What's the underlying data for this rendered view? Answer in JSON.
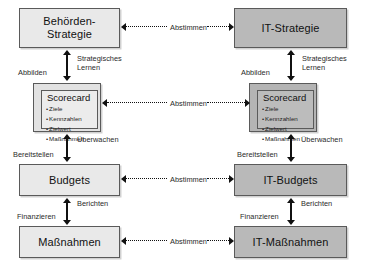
{
  "diagram": {
    "colors": {
      "business_fill": "#e9e9e9",
      "it_fill": "#b9b9b9",
      "border": "#5a5a5a",
      "arrow": "#111111",
      "background": "#ffffff"
    },
    "columns": [
      {
        "id": "business",
        "label": "Behoerde"
      },
      {
        "id": "it",
        "label": "IT"
      }
    ],
    "nodes": {
      "behoerden_strategie": {
        "line1": "Behörden-",
        "line2": "Strategie"
      },
      "it_strategie": {
        "line1": "IT-Strategie",
        "line2": ""
      },
      "scorecard_left": {
        "title": "Scorecard",
        "items": [
          "Ziele",
          "Kennzahlen",
          "Zielwert",
          "Maßnahmen"
        ]
      },
      "scorecard_right": {
        "title": "Scorecard",
        "items": [
          "Ziele",
          "Kennzahlen",
          "Zielwert",
          "Maßnahmen"
        ]
      },
      "budgets": {
        "line1": "Budgets",
        "line2": ""
      },
      "it_budgets": {
        "line1": "IT-Budgets",
        "line2": ""
      },
      "massnahmen": {
        "line1": "Maßnahmen",
        "line2": ""
      },
      "it_massnahmen": {
        "line1": "IT-Maßnahmen",
        "line2": ""
      }
    },
    "vertical_labels": {
      "left_strategie_scorecard_down": "Abbilden",
      "left_strategie_scorecard_up": "Strategisches Lernen",
      "left_scorecard_budgets_down": "Bereitstellen",
      "left_scorecard_budgets_up": "Überwachen",
      "left_budgets_massnahmen_down": "Finanzieren",
      "left_budgets_massnahmen_up": "Berichten",
      "right_strategie_scorecard_down": "Abbilden",
      "right_strategie_scorecard_up": "Strategisches Lernen",
      "right_scorecard_budgets_down": "Bereitstellen",
      "right_scorecard_budgets_up": "Überwachen",
      "right_budgets_massnahmen_down": "Finanzieren",
      "right_budgets_massnahmen_up": "Berichten"
    },
    "horizontal_labels": {
      "strategie": "Abstimmen",
      "scorecard": "Abstimmen",
      "budgets": "Abstimmen",
      "massnahmen": "Abstimmen"
    }
  }
}
